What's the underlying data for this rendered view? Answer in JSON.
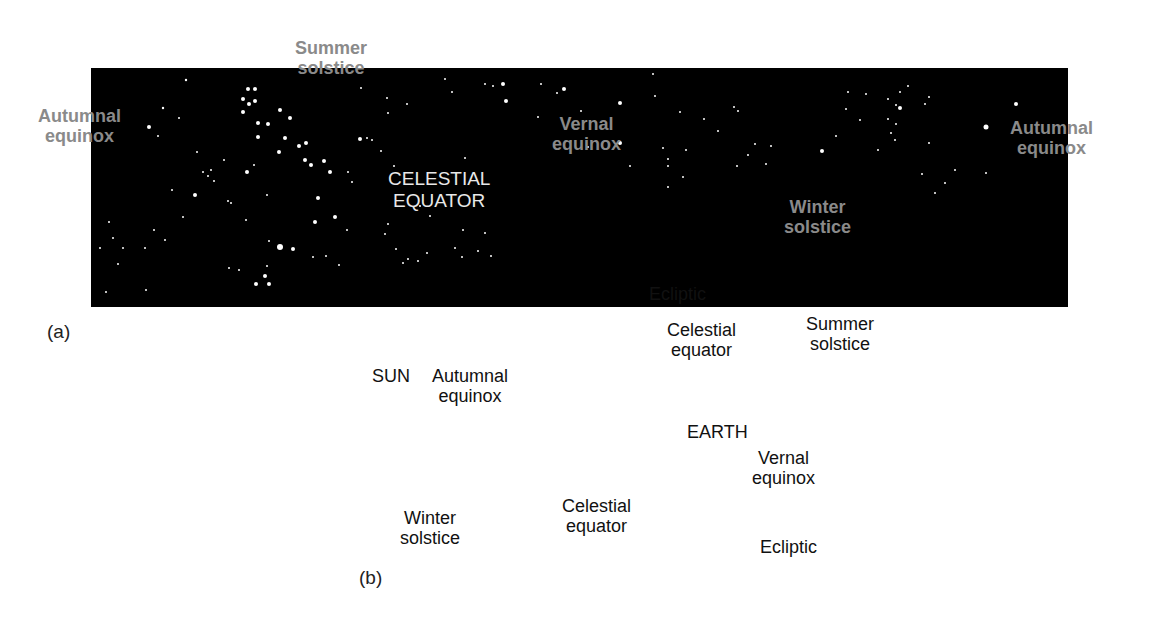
{
  "figure": {
    "panel_a": {
      "label": "(a)",
      "equator_label_line1": "CELESTIAL",
      "equator_label_line2": "EQUATOR",
      "markers": [
        {
          "name": "Autumnal equinox",
          "line1": "Autumnal",
          "line2": "equinox",
          "position": "left"
        },
        {
          "name": "Summer solstice",
          "line1": "Summer",
          "line2": "solstice",
          "position": "top"
        },
        {
          "name": "Vernal equinox",
          "line1": "Vernal",
          "line2": "equinox",
          "position": "middle"
        },
        {
          "name": "Winter solstice",
          "line1": "Winter",
          "line2": "solstice",
          "position": "bottom"
        },
        {
          "name": "Autumnal equinox",
          "line1": "Autumnal",
          "line2": "equinox",
          "position": "right"
        }
      ]
    },
    "panel_b": {
      "label": "(b)",
      "ecliptic_top": "Ecliptic",
      "ecliptic_bottom": "Ecliptic",
      "celestial_equator_back_line1": "Celestial",
      "celestial_equator_back_line2": "equator",
      "celestial_equator_front_line1": "Celestial",
      "celestial_equator_front_line2": "equator",
      "sun": "SUN",
      "earth": "EARTH",
      "summer_solstice_line1": "Summer",
      "summer_solstice_line2": "solstice",
      "autumnal_equinox_line1": "Autumnal",
      "autumnal_equinox_line2": "equinox",
      "vernal_equinox_line1": "Vernal",
      "vernal_equinox_line2": "equinox",
      "winter_solstice_line1": "Winter",
      "winter_solstice_line2": "solstice"
    }
  },
  "colors": {
    "sky": "#000000",
    "ecliptic_curve": "#b8b8b8",
    "equator_dash": "#8c8c8c",
    "sky_label": "#8a8a8a",
    "band_light": "#d9d9d9",
    "band_dark": "#7a7a7a",
    "white_dash": "#f2f2f2",
    "black_dash": "#111111"
  }
}
